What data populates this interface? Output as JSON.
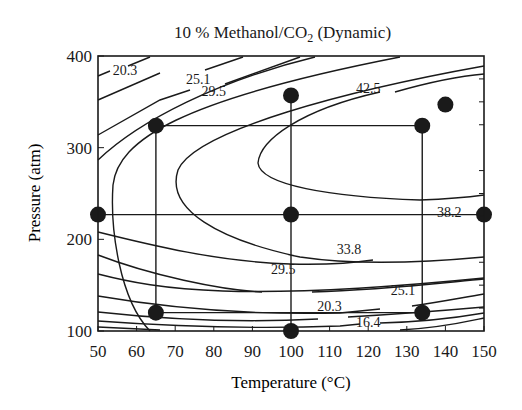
{
  "chart_data": {
    "type": "contour",
    "title": "10 % Methanol/CO2 (Dynamic)",
    "title_main": "10 % Methanol/CO",
    "title_sub": "2",
    "title_tail": " (Dynamic)",
    "xlabel": "Temperature (°C)",
    "ylabel": "Pressure (atm)",
    "xlim": [
      50,
      150
    ],
    "ylim": [
      100,
      400
    ],
    "xticks": [
      50,
      60,
      70,
      80,
      90,
      100,
      110,
      120,
      130,
      140,
      150
    ],
    "yticks": [
      100,
      200,
      300,
      400
    ],
    "grid": false,
    "legend": null,
    "contour_levels": [
      16.4,
      20.3,
      25.1,
      29.5,
      33.8,
      38.2,
      42.5
    ],
    "contour_labels": [
      {
        "text": "20.3",
        "x": 57,
        "y": 385
      },
      {
        "text": "25.1",
        "x": 76,
        "y": 375
      },
      {
        "text": "29.5",
        "x": 80,
        "y": 362
      },
      {
        "text": "42.5",
        "x": 120,
        "y": 365
      },
      {
        "text": "38.2",
        "x": 141,
        "y": 230
      },
      {
        "text": "33.8",
        "x": 115,
        "y": 190
      },
      {
        "text": "29.5",
        "x": 98,
        "y": 168
      },
      {
        "text": "25.1",
        "x": 129,
        "y": 145
      },
      {
        "text": "20.3",
        "x": 110,
        "y": 127
      },
      {
        "text": "16.4",
        "x": 120,
        "y": 110
      }
    ],
    "experimental_points": [
      {
        "temperature": 50,
        "pressure": 227
      },
      {
        "temperature": 65,
        "pressure": 324
      },
      {
        "temperature": 100,
        "pressure": 357
      },
      {
        "temperature": 100,
        "pressure": 227
      },
      {
        "temperature": 134,
        "pressure": 324
      },
      {
        "temperature": 140,
        "pressure": 347
      },
      {
        "temperature": 150,
        "pressure": 227
      },
      {
        "temperature": 65,
        "pressure": 120
      },
      {
        "temperature": 100,
        "pressure": 100
      },
      {
        "temperature": 134,
        "pressure": 120
      }
    ],
    "design_lines": [
      {
        "from": [
          65,
          324
        ],
        "to": [
          134,
          324
        ]
      },
      {
        "from": [
          50,
          227
        ],
        "to": [
          150,
          227
        ]
      },
      {
        "from": [
          65,
          120
        ],
        "to": [
          134,
          120
        ]
      },
      {
        "from": [
          65,
          324
        ],
        "to": [
          65,
          120
        ]
      },
      {
        "from": [
          100,
          357
        ],
        "to": [
          100,
          100
        ]
      },
      {
        "from": [
          134,
          324
        ],
        "to": [
          134,
          120
        ]
      }
    ],
    "colors": {
      "ink": "#1a1a1a",
      "background": "#ffffff"
    }
  }
}
